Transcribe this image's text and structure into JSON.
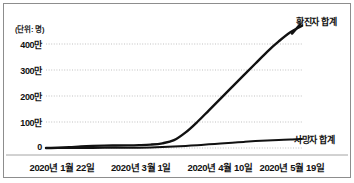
{
  "chart_data": {
    "type": "line",
    "title": "",
    "subtitle": "",
    "unit_note": "(단위: 명)",
    "xlabel": "",
    "ylabel": "",
    "grid": true,
    "legend_position": "right-inline",
    "x_categories": [
      "2020년 1월 22일",
      "2020년 3월 1일",
      "2020년 4월 10일",
      "2020년 5월 19일"
    ],
    "y_ticks": [
      "0",
      "100만",
      "200만",
      "300만",
      "400만"
    ],
    "y_tick_values": [
      0,
      1000000,
      2000000,
      3000000,
      4000000
    ],
    "ylim": [
      0,
      4700000
    ],
    "series": [
      {
        "name": "확진자 합계",
        "color": "#111111",
        "label_x": 296,
        "label_y": 15,
        "values": [
          0,
          10000,
          30000,
          60000,
          80000,
          90000,
          95000,
          100000,
          110000,
          130000,
          180000,
          300000,
          600000,
          1000000,
          1450000,
          1900000,
          2350000,
          2800000,
          3250000,
          3700000,
          4100000,
          4450000,
          4700000
        ]
      },
      {
        "name": "사망자 합계",
        "color": "#111111",
        "label_x": 294,
        "label_y": 133,
        "values": [
          0,
          1000,
          2000,
          3000,
          4000,
          5000,
          6000,
          8000,
          12000,
          20000,
          35000,
          55000,
          80000,
          110000,
          140000,
          175000,
          205000,
          235000,
          265000,
          290000,
          310000,
          325000,
          350000
        ]
      }
    ]
  },
  "geometry": {
    "plot_left": 46,
    "plot_right": 302,
    "y_zero": 148,
    "px_per_million": 26,
    "x_tick_positions": [
      62,
      141,
      220,
      292
    ],
    "y_tick_positions": [
      148,
      122,
      96,
      70,
      44
    ],
    "ytick_label_right": 42
  },
  "colors": {
    "background": "#ffffff",
    "frame": "#8d8d8d",
    "grid": "#a8a8a8",
    "line": "#111111",
    "text": "#111111"
  }
}
